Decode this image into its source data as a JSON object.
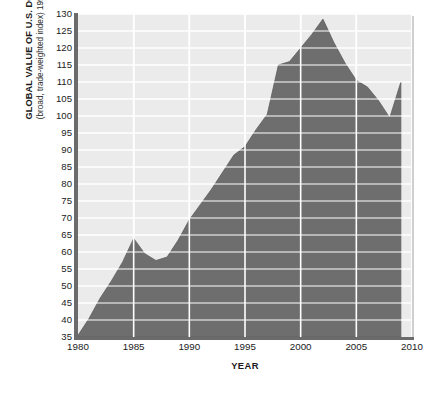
{
  "chart_data": {
    "type": "area",
    "title": "",
    "ylabel": "GLOBAL VALUE OF U.S. DOLLAR",
    "ylabel_sub": "(broad, trade-weighted index) 1997 = 100",
    "xlabel": "YEAR",
    "xlim": [
      1980,
      2010
    ],
    "ylim": [
      35,
      130
    ],
    "grid": true,
    "legend": false,
    "xticks": [
      "1980",
      "1985",
      "1990",
      "1995",
      "2000",
      "2005",
      "2010"
    ],
    "xtick_values": [
      1980,
      1985,
      1990,
      1995,
      2000,
      2005,
      2010
    ],
    "yticks": [
      "130",
      "125",
      "120",
      "115",
      "110",
      "105",
      "100",
      "95",
      "90",
      "85",
      "80",
      "75",
      "70",
      "65",
      "60",
      "55",
      "50",
      "45",
      "40",
      "35"
    ],
    "ytick_values": [
      130,
      125,
      120,
      115,
      110,
      105,
      100,
      95,
      90,
      85,
      80,
      75,
      70,
      65,
      60,
      55,
      50,
      45,
      40,
      35
    ],
    "series": [
      {
        "name": "Global value of U.S. dollar",
        "x": [
          1980,
          1981,
          1982,
          1983,
          1984,
          1985,
          1986,
          1987,
          1988,
          1989,
          1990,
          1991,
          1992,
          1993,
          1994,
          1995,
          1996,
          1997,
          1998,
          1999,
          2000,
          2001,
          2002,
          2003,
          2004,
          2005,
          2006,
          2007,
          2008,
          2009
        ],
        "values": [
          35.5,
          40.5,
          46.5,
          51.5,
          57.0,
          64.0,
          59.5,
          57.5,
          58.5,
          63.5,
          69.5,
          74.0,
          78.5,
          83.5,
          88.5,
          91.0,
          96.0,
          100.5,
          115.0,
          116.0,
          120.0,
          124.0,
          128.5,
          121.5,
          115.5,
          110.5,
          108.5,
          104.5,
          99.5,
          110.0
        ],
        "fill_color": "#6e6e6e",
        "line_color": "#5e5e5e"
      }
    ],
    "colors": {
      "plot_background": "#ebebeb",
      "gridline": "#ffffff",
      "area_fill": "#6e6e6e",
      "axis": "#6b6b6b",
      "text": "#1b1b1b"
    }
  }
}
